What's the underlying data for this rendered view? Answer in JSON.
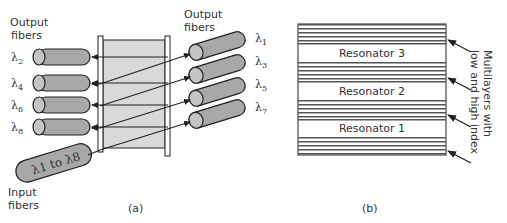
{
  "panel_a": {
    "caption": "(a)",
    "output_fibers_left_label_1": "Output",
    "output_fibers_left_label_2": "fibers",
    "output_fibers_right_label_1": "Output",
    "output_fibers_right_label_2": "fibers",
    "input_fibers_label_1": "Input",
    "input_fibers_label_2": "fibers",
    "input_fiber_text": "λ1 to λ8",
    "left_fibers": [
      {
        "lambda": "λ",
        "sub": "2"
      },
      {
        "lambda": "λ",
        "sub": "4"
      },
      {
        "lambda": "λ",
        "sub": "6"
      },
      {
        "lambda": "λ",
        "sub": "8"
      }
    ],
    "right_fibers": [
      {
        "lambda": "λ",
        "sub": "1"
      },
      {
        "lambda": "λ",
        "sub": "3"
      },
      {
        "lambda": "λ",
        "sub": "5"
      },
      {
        "lambda": "λ",
        "sub": "7"
      }
    ]
  },
  "panel_b": {
    "caption": "(b)",
    "resonators": [
      "Resonator 3",
      "Resonator 2",
      "Resonator 1"
    ],
    "annotation_line_1": "Multilayers with",
    "annotation_line_2": "low and high index"
  },
  "colors": {
    "fiber_fill": "#a8a8a8",
    "fiber_end": "#c4c4c4",
    "filter_fill": "#d9d9d9",
    "stroke": "#222222",
    "stripe": "#555555"
  }
}
